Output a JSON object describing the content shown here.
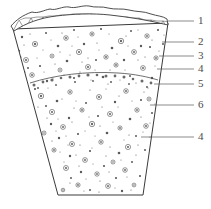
{
  "figure": {
    "shape_name": "fan-shaped sector cross-section",
    "caption": ""
  },
  "labels": [
    {
      "id": "1",
      "text": "1",
      "x": 201,
      "y": 21,
      "leader_from_x": 168,
      "leader_from_y": 21,
      "leader_to_x": 194,
      "leader_to_y": 21
    },
    {
      "id": "2",
      "text": "2",
      "x": 201,
      "y": 42,
      "leader_from_x": 162,
      "leader_from_y": 42,
      "leader_to_x": 194,
      "leader_to_y": 42
    },
    {
      "id": "3",
      "text": "3",
      "x": 201,
      "y": 56,
      "leader_from_x": 159,
      "leader_from_y": 56,
      "leader_to_x": 194,
      "leader_to_y": 56
    },
    {
      "id": "4a",
      "text": "4",
      "x": 201,
      "y": 69,
      "leader_from_x": 157,
      "leader_from_y": 69,
      "leader_to_x": 194,
      "leader_to_y": 69
    },
    {
      "id": "5",
      "text": "5",
      "x": 201,
      "y": 84,
      "leader_from_x": 154,
      "leader_from_y": 84,
      "leader_to_x": 194,
      "leader_to_y": 84
    },
    {
      "id": "6",
      "text": "6",
      "x": 201,
      "y": 105,
      "leader_from_x": 150,
      "leader_from_y": 105,
      "leader_to_x": 194,
      "leader_to_y": 105
    },
    {
      "id": "4b",
      "text": "4",
      "x": 201,
      "y": 137,
      "leader_from_x": 141,
      "leader_from_y": 137,
      "leader_to_x": 194,
      "leader_to_y": 137
    }
  ],
  "geometry": {
    "body_outline": "M13,29 L58,195 L143,195 L168,23 Z",
    "crust_band_top": "M11,26 C22,17 36,11 52,9 C70,7 90,6 108,8 C126,10 146,14 167,19",
    "crust_band_bottom": "M14,31 C26,23 40,18 56,16 C73,14 92,13 110,15 C128,17 148,20 168,25",
    "horizon_arc": "M30,83 C55,75 86,71 118,73 C135,74 148,77 158,80"
  },
  "colors": {
    "stroke": "#3a3a3a",
    "label": "#4a4a4a",
    "clast_fill": "#ffffff",
    "speck": "#5a5a5a",
    "background": "#ffffff"
  },
  "legend_keys": {
    "1": "1",
    "2": "2",
    "3": "3",
    "4": "4",
    "5": "5",
    "6": "6"
  }
}
